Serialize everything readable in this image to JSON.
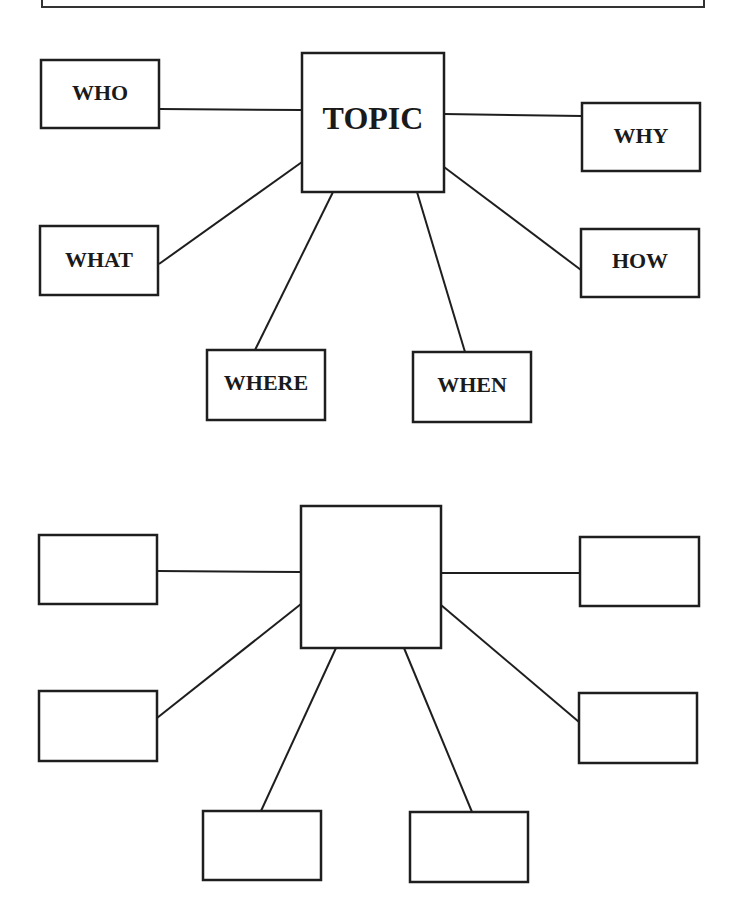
{
  "banner": {
    "text": ""
  },
  "diagrams": [
    {
      "name": "example-topic-map",
      "center": {
        "label": "TOPIC"
      },
      "nodes": [
        {
          "id": "who",
          "label": "WHO"
        },
        {
          "id": "why",
          "label": "WHY"
        },
        {
          "id": "what",
          "label": "WHAT"
        },
        {
          "id": "how",
          "label": "HOW"
        },
        {
          "id": "where",
          "label": "WHERE"
        },
        {
          "id": "when",
          "label": "WHEN"
        }
      ]
    },
    {
      "name": "blank-topic-map",
      "center": {
        "label": ""
      },
      "nodes": [
        {
          "id": "box1",
          "label": ""
        },
        {
          "id": "box2",
          "label": ""
        },
        {
          "id": "box3",
          "label": ""
        },
        {
          "id": "box4",
          "label": ""
        },
        {
          "id": "box5",
          "label": ""
        },
        {
          "id": "box6",
          "label": ""
        }
      ]
    }
  ],
  "colors": {
    "stroke": "#1e1e1e",
    "background": "#ffffff",
    "text": "#1a1a1a"
  }
}
